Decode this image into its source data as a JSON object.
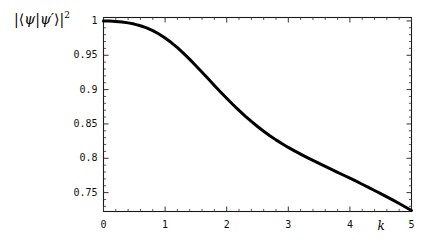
{
  "chart_data": {
    "type": "line",
    "title": "",
    "subtitle": "",
    "xlabel": "k",
    "ylabel": "|⟨ψ|ψ′⟩|²",
    "xlim": [
      0,
      5
    ],
    "ylim": [
      0.7225,
      1.005
    ],
    "grid": false,
    "legend": null,
    "x_ticks": [
      0,
      1,
      2,
      3,
      4,
      5
    ],
    "x_tick_labels": [
      "0",
      "1",
      "2",
      "3",
      "4",
      "5"
    ],
    "y_ticks": [
      1,
      0.95,
      0.9,
      0.85,
      0.8,
      0.75
    ],
    "y_tick_labels": [
      "1",
      "0.95",
      "0.9",
      "0.85",
      "0.8",
      "0.75"
    ],
    "x_minor_tick_count": 4,
    "y_minor_tick_count": 4,
    "series": [
      {
        "name": "overlap",
        "color": "#000000",
        "linewidth": 3,
        "x": [
          0.0,
          0.1,
          0.2,
          0.3,
          0.4,
          0.5,
          0.6,
          0.7,
          0.8,
          0.9,
          1.0,
          1.1,
          1.2,
          1.3,
          1.4,
          1.5,
          1.6,
          1.7,
          1.8,
          1.9,
          2.0,
          2.1,
          2.2,
          2.3,
          2.4,
          2.5,
          2.6,
          2.7,
          2.8,
          2.9,
          3.0,
          3.1,
          3.2,
          3.3,
          3.4,
          3.5,
          3.6,
          3.7,
          3.8,
          3.9,
          4.0,
          4.1,
          4.2,
          4.3,
          4.4,
          4.5,
          4.6,
          4.7,
          4.8,
          4.9,
          5.0
        ],
        "values": [
          1.0,
          0.9998,
          0.9993,
          0.9985,
          0.9972,
          0.9954,
          0.993,
          0.9898,
          0.9858,
          0.981,
          0.9752,
          0.9685,
          0.961,
          0.9528,
          0.944,
          0.9348,
          0.9253,
          0.9157,
          0.9061,
          0.8966,
          0.8873,
          0.8783,
          0.8697,
          0.8615,
          0.8537,
          0.8463,
          0.8394,
          0.8329,
          0.8268,
          0.8211,
          0.8158,
          0.8108,
          0.806,
          0.8014,
          0.7969,
          0.7925,
          0.7882,
          0.7839,
          0.7796,
          0.7753,
          0.771,
          0.7666,
          0.7622,
          0.7577,
          0.7531,
          0.7485,
          0.7438,
          0.739,
          0.7341,
          0.7291,
          0.724
        ]
      }
    ],
    "key_points": [
      {
        "x": 0,
        "y": 1.0
      },
      {
        "x": 1,
        "y": 0.975
      },
      {
        "x": 2,
        "y": 0.887
      },
      {
        "x": 3,
        "y": 0.816
      },
      {
        "x": 4,
        "y": 0.771
      },
      {
        "x": 5,
        "y": 0.724
      }
    ]
  },
  "axes": {
    "ylabel_parts": {
      "open_bar": "|",
      "open_angle": "⟨",
      "psi": "ψ",
      "mid_bar": "|",
      "psi_prime": "ψ′",
      "close_angle": "⟩",
      "close_bar": "|",
      "exponent": "2"
    }
  },
  "colors": {
    "curve": "#000000",
    "frame": "#1a1a1a",
    "tick": "#333333",
    "background": "#ffffff",
    "text": "#111111"
  }
}
